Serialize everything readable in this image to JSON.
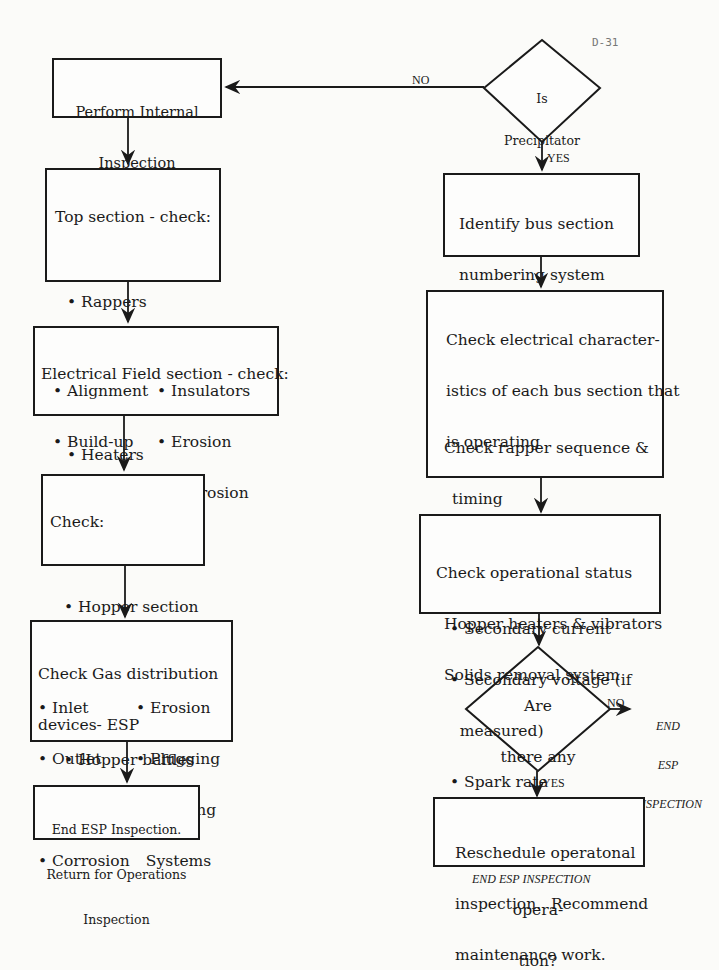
{
  "page_number": "D-31",
  "decision_top": {
    "lines": [
      "Is",
      "Precipitator",
      "Operating?"
    ],
    "no_label": "NO",
    "yes_label": "YES"
  },
  "left_flow": {
    "perform": {
      "lines": [
        "Perform Internal",
        "Inspection"
      ]
    },
    "top_section": {
      "title": "Top section - check:",
      "items": [
        "Rappers",
        "Drives",
        "Insulators",
        "Heaters",
        "Blowers"
      ]
    },
    "electrical_field": {
      "title": "Electrical Field section - check:",
      "col1": [
        "Alignment",
        "Build-up",
        "Rappers",
        "Drives"
      ],
      "col2": [
        "Insulators",
        "Erosion",
        "Corrosion"
      ]
    },
    "hopper": {
      "title": "Check:",
      "items": [
        "Hopper section",
        "Build-up",
        "Corrosion",
        "Hopper baffles"
      ]
    },
    "gas_distribution": {
      "title1": "Check Gas distribution",
      "title2": "devices- ESP",
      "col1": [
        "Inlet",
        "Outlet",
        "Ductwork",
        "Corrosion"
      ],
      "col2": [
        "Erosion",
        "Plugging",
        "Rapping",
        "Systems"
      ]
    },
    "end": {
      "lines": [
        "End ESP Inspection.",
        "Return for Operations",
        "Inspection"
      ]
    }
  },
  "right_flow": {
    "identify": {
      "lines": [
        "Identify bus section",
        "numbering system",
        "Check for bus sections",
        "which are not operating."
      ]
    },
    "electrical": {
      "lines": [
        "Check electrical character-",
        "istics of each bus section that",
        "is operating"
      ],
      "items": [
        "Primary voltage",
        "Primary current",
        "Secondary current",
        "Secondary voltage (if",
        "measured)",
        "Spark rate"
      ],
      "after": [
        "Check rapper sequence &",
        "timing",
        "Check insulators purge &",
        "heating system."
      ]
    },
    "operational": {
      "lines": [
        "Check operational status",
        "Hopper heaters & vibrators",
        "Solids removal system"
      ]
    },
    "decision": {
      "lines": [
        "Are",
        "there any",
        "indications of",
        "non-compliance",
        "opera-",
        "tion?"
      ],
      "no_label": "NO",
      "yes_label": "YES",
      "no_end": [
        "END",
        "ESP",
        "INSPECTION"
      ]
    },
    "reschedule": {
      "lines": [
        "Reschedule operatonal",
        "inspection.  Recommend",
        "maintenance work."
      ]
    },
    "end_label": "END ESP INSPECTION"
  }
}
